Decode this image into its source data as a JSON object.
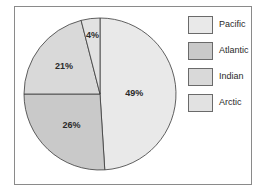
{
  "chart_data": {
    "type": "pie",
    "title": "",
    "categories": [
      "Pacific",
      "Atlantic",
      "Indian",
      "Arctic"
    ],
    "values": [
      49,
      26,
      21,
      4
    ],
    "unit": "%",
    "labels": [
      "49%",
      "26%",
      "21%",
      "4%"
    ],
    "colors": [
      "#e9e9e9",
      "#c9c9c9",
      "#d9d9d9",
      "#e2e2e2"
    ],
    "start_angle_deg": 0,
    "direction": "clockwise",
    "legend_position": "right"
  },
  "legend": {
    "items": [
      {
        "label": "Pacific",
        "color": "#e9e9e9"
      },
      {
        "label": "Atlantic",
        "color": "#c9c9c9"
      },
      {
        "label": "Indian",
        "color": "#d9d9d9"
      },
      {
        "label": "Arctic",
        "color": "#e2e2e2"
      }
    ]
  }
}
